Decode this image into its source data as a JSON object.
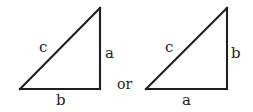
{
  "figure": {
    "type": "geometry-diagram",
    "background_color": "#ffffff",
    "stroke_color": "#1f1f1f",
    "text_color": "#1f1f1f",
    "connector_text": "or"
  },
  "triangles": [
    {
      "id": "left-triangle",
      "name": "left-right-triangle",
      "right_angle_corner": "bottom-right",
      "vertices": {
        "bottom_left": [
          20,
          89
        ],
        "bottom_right": [
          100,
          89
        ],
        "apex": [
          100,
          8
        ]
      },
      "labels": {
        "hypotenuse": "c",
        "vertical_leg": "a",
        "horizontal_leg": "b"
      }
    },
    {
      "id": "right-triangle",
      "name": "right-right-triangle",
      "right_angle_corner": "bottom-right",
      "vertices": {
        "bottom_left": [
          146,
          89
        ],
        "bottom_right": [
          227,
          89
        ],
        "apex": [
          227,
          8
        ]
      },
      "labels": {
        "hypotenuse": "c",
        "vertical_leg": "b",
        "horizontal_leg": "a"
      }
    }
  ]
}
